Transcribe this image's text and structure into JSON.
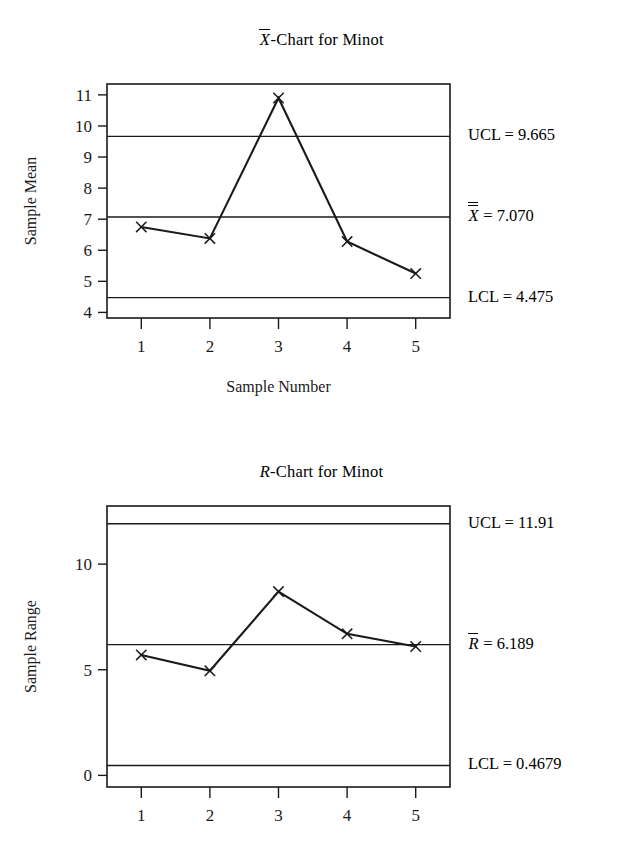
{
  "chart_data": [
    {
      "type": "line",
      "id": "xbar-chart",
      "title": "X̄-Chart for Minot",
      "title_parts": {
        "symbol": "X",
        "overbars": 1,
        "suffix": "-Chart for Minot"
      },
      "xlabel": "Sample Number",
      "ylabel": "Sample Mean",
      "categories": [
        "1",
        "2",
        "3",
        "4",
        "5"
      ],
      "x": [
        1,
        2,
        3,
        4,
        5
      ],
      "values": [
        6.75,
        6.38,
        10.9,
        6.28,
        5.25
      ],
      "marker": "x",
      "xlim": [
        0.5,
        5.5
      ],
      "ylim": [
        3.82,
        11.35
      ],
      "yticks": [
        4,
        5,
        6,
        7,
        8,
        9,
        10,
        11
      ],
      "ytick_labels": [
        "4",
        "5",
        "6",
        "7",
        "8",
        "9",
        "10",
        "11"
      ],
      "xticks": [
        1,
        2,
        3,
        4,
        5
      ],
      "xtick_labels": [
        "1",
        "2",
        "3",
        "4",
        "5"
      ],
      "grid": false,
      "legend": "right-outside",
      "control_limits": [
        {
          "name": "UCL",
          "label": "UCL = 9.665",
          "value": 9.665,
          "symbol": "UCL",
          "number": "9.665"
        },
        {
          "name": "center",
          "label": "X̿ = 7.070",
          "value": 7.07,
          "symbol": "X",
          "overbars": 2,
          "number": "7.070"
        },
        {
          "name": "LCL",
          "label": "LCL = 4.475",
          "value": 4.475,
          "symbol": "LCL",
          "number": "4.475"
        }
      ]
    },
    {
      "type": "line",
      "id": "r-chart",
      "title": "R-Chart for Minot",
      "title_parts": {
        "symbol": "R",
        "overbars": 0,
        "suffix": "-Chart for Minot"
      },
      "xlabel": "",
      "ylabel": "Sample Range",
      "categories": [
        "1",
        "2",
        "3",
        "4",
        "5"
      ],
      "x": [
        1,
        2,
        3,
        4,
        5
      ],
      "values": [
        5.7,
        4.95,
        8.7,
        6.7,
        6.1
      ],
      "marker": "x",
      "xlim": [
        0.5,
        5.5
      ],
      "ylim": [
        -0.55,
        12.75
      ],
      "yticks": [
        0,
        5,
        10
      ],
      "ytick_labels": [
        "0",
        "5",
        "10"
      ],
      "xticks": [
        1,
        2,
        3,
        4,
        5
      ],
      "xtick_labels": [
        "1",
        "2",
        "3",
        "4",
        "5"
      ],
      "grid": false,
      "legend": "right-outside",
      "control_limits": [
        {
          "name": "UCL",
          "label": "UCL = 11.91",
          "value": 11.91,
          "symbol": "UCL",
          "number": "11.91"
        },
        {
          "name": "center",
          "label": "R̄ = 6.189",
          "value": 6.189,
          "symbol": "R",
          "overbars": 1,
          "number": "6.189"
        },
        {
          "name": "LCL",
          "label": "LCL = 0.4679",
          "value": 0.4679,
          "symbol": "LCL",
          "number": "0.4679"
        }
      ]
    }
  ],
  "colors": {
    "ink": "#1a1a1a",
    "background": "#ffffff"
  }
}
